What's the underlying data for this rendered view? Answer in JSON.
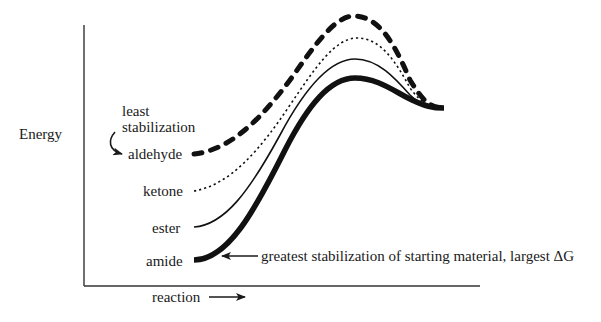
{
  "diagram": {
    "type": "reaction-energy-diagram",
    "y_axis_label": "Energy",
    "x_axis_label": "reaction",
    "annotation_top": {
      "line1": "least",
      "line2": "stabilization"
    },
    "annotation_bottom": "greatest stabilization of starting material, largest ΔG",
    "curves": [
      {
        "name": "aldehyde",
        "label": "aldehyde",
        "style": "thick-dashed",
        "relative_start_energy": 4
      },
      {
        "name": "ketone",
        "label": "ketone",
        "style": "dotted",
        "relative_start_energy": 3
      },
      {
        "name": "ester",
        "label": "ester",
        "style": "thin-solid",
        "relative_start_energy": 2
      },
      {
        "name": "amide",
        "label": "amide",
        "style": "thick-solid",
        "relative_start_energy": 1
      }
    ],
    "colors": {
      "ink": "#1a1a1a",
      "background": "#ffffff"
    }
  }
}
